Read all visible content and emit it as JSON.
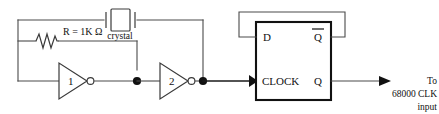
{
  "diagram": {
    "background_color": "#ffffff",
    "wire_color": "#4a4a4a",
    "ink_color": "#111111"
  },
  "components": {
    "resistor": {
      "label": "R = 1K Ω",
      "symbol": "zigzag-resistor"
    },
    "crystal": {
      "label": "crystal",
      "symbol": "quartz-crystal"
    },
    "inverter1": {
      "label": "1",
      "symbol": "inverter-triangle-bubble"
    },
    "inverter2": {
      "label": "2",
      "symbol": "inverter-triangle-bubble"
    },
    "flipflop": {
      "pin_d": "D",
      "pin_qbar": "Q",
      "pin_clock": "CLOCK",
      "pin_q": "Q"
    }
  },
  "output": {
    "line1": "To",
    "line2": "68000 CLK",
    "line3": "input"
  }
}
